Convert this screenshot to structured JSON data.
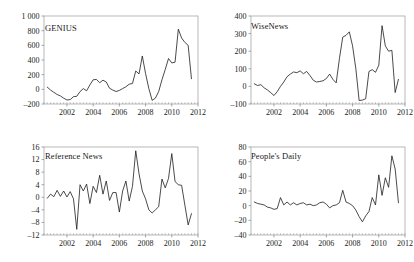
{
  "figure": {
    "type": "multi-panel-line-chart",
    "panel_count": 4,
    "layout": "2x2"
  },
  "chart_data": [
    {
      "type": "line",
      "title": "GENIUS",
      "panel": "top-left",
      "xlabel": "",
      "ylabel": "",
      "xlim": [
        2000.25,
        2012.0
      ],
      "ylim": [
        -200,
        1000
      ],
      "yticks": [
        -200,
        0,
        200,
        400,
        600,
        800,
        1000
      ],
      "ytick_labels": [
        "-200",
        "0",
        "200",
        "400",
        "600",
        "800",
        "1 000"
      ],
      "xticks": [
        2002,
        2004,
        2006,
        2008,
        2010,
        2012
      ],
      "xtick_labels": [
        "2002",
        "2004",
        "2006",
        "2008",
        "2010",
        "2012"
      ],
      "grid": false,
      "legend": "none",
      "x": [
        2000.5,
        2000.75,
        2001.0,
        2001.25,
        2001.5,
        2001.75,
        2002.0,
        2002.25,
        2002.5,
        2002.75,
        2003.0,
        2003.25,
        2003.5,
        2003.75,
        2004.0,
        2004.25,
        2004.5,
        2004.75,
        2005.0,
        2005.25,
        2005.5,
        2005.75,
        2006.0,
        2006.25,
        2006.5,
        2006.75,
        2007.0,
        2007.25,
        2007.5,
        2007.75,
        2008.0,
        2008.25,
        2008.5,
        2008.75,
        2009.0,
        2009.25,
        2009.5,
        2009.75,
        2010.0,
        2010.25,
        2010.5,
        2010.75,
        2011.0,
        2011.25,
        2011.5
      ],
      "values": [
        30,
        -10,
        -40,
        -70,
        -90,
        -120,
        -145,
        -140,
        -100,
        -95,
        -30,
        10,
        -20,
        60,
        130,
        135,
        90,
        125,
        100,
        15,
        -10,
        -30,
        -15,
        10,
        35,
        70,
        80,
        250,
        210,
        455,
        215,
        10,
        -150,
        -120,
        -30,
        130,
        270,
        420,
        360,
        370,
        820,
        700,
        640,
        600,
        145
      ]
    },
    {
      "type": "line",
      "title": "WiseNews",
      "panel": "top-right",
      "xlabel": "",
      "ylabel": "",
      "xlim": [
        2000.25,
        2012.0
      ],
      "ylim": [
        -100,
        400
      ],
      "yticks": [
        -100,
        0,
        100,
        200,
        300,
        400
      ],
      "ytick_labels": [
        "-100",
        "0",
        "100",
        "200",
        "300",
        "400"
      ],
      "xticks": [
        2002,
        2004,
        2006,
        2008,
        2010,
        2012
      ],
      "xtick_labels": [
        "2002",
        "2004",
        "2006",
        "2008",
        "2010",
        "2012"
      ],
      "grid": false,
      "legend": "none",
      "x": [
        2000.5,
        2000.75,
        2001.0,
        2001.25,
        2001.5,
        2001.75,
        2002.0,
        2002.25,
        2002.5,
        2002.75,
        2003.0,
        2003.25,
        2003.5,
        2003.75,
        2004.0,
        2004.25,
        2004.5,
        2004.75,
        2005.0,
        2005.25,
        2005.5,
        2005.75,
        2006.0,
        2006.25,
        2006.5,
        2006.75,
        2007.0,
        2007.25,
        2007.5,
        2007.75,
        2008.0,
        2008.25,
        2008.5,
        2008.75,
        2009.0,
        2009.25,
        2009.5,
        2009.75,
        2010.0,
        2010.25,
        2010.5,
        2010.75,
        2011.0,
        2011.25,
        2011.5
      ],
      "values": [
        15,
        5,
        10,
        -8,
        -20,
        -35,
        -52,
        -30,
        0,
        25,
        55,
        70,
        82,
        78,
        88,
        72,
        85,
        62,
        35,
        25,
        28,
        32,
        45,
        70,
        40,
        20,
        160,
        280,
        290,
        310,
        230,
        100,
        -80,
        -78,
        -70,
        85,
        95,
        80,
        120,
        345,
        230,
        200,
        205,
        -35,
        40
      ]
    },
    {
      "type": "line",
      "title": "Reference News",
      "panel": "bottom-left",
      "xlabel": "",
      "ylabel": "",
      "xlim": [
        2000.25,
        2012.0
      ],
      "ylim": [
        -12,
        16
      ],
      "yticks": [
        -12,
        -8,
        -4,
        0,
        4,
        8,
        12,
        16
      ],
      "ytick_labels": [
        "-12",
        "-8",
        "-4",
        "0",
        "4",
        "8",
        "12",
        "16"
      ],
      "xticks": [
        2002,
        2004,
        2006,
        2008,
        2010,
        2012
      ],
      "xtick_labels": [
        "2002",
        "2004",
        "2006",
        "2008",
        "2010",
        "2012"
      ],
      "grid": false,
      "legend": "none",
      "x": [
        2000.5,
        2000.75,
        2001.0,
        2001.25,
        2001.5,
        2001.75,
        2002.0,
        2002.25,
        2002.5,
        2002.75,
        2003.0,
        2003.25,
        2003.5,
        2003.75,
        2004.0,
        2004.25,
        2004.5,
        2004.75,
        2005.0,
        2005.25,
        2005.5,
        2005.75,
        2006.0,
        2006.25,
        2006.5,
        2006.75,
        2007.0,
        2007.25,
        2007.5,
        2007.75,
        2008.0,
        2008.25,
        2008.5,
        2008.75,
        2009.0,
        2009.25,
        2009.5,
        2009.75,
        2010.0,
        2010.25,
        2010.5,
        2010.75,
        2011.0,
        2011.25,
        2011.5
      ],
      "values": [
        -0.3,
        1.0,
        0.2,
        2.2,
        0.3,
        2.0,
        0.1,
        1.8,
        -0.5,
        -10.2,
        4.0,
        2.0,
        4.2,
        -2.0,
        3.5,
        1.5,
        7.0,
        1.0,
        5.2,
        -1.0,
        1.5,
        1.5,
        -4.7,
        2.0,
        5.2,
        -1.2,
        3.5,
        14.8,
        7.5,
        2.0,
        -0.5,
        -4.0,
        -5.0,
        -4.0,
        -3.0,
        5.8,
        3.0,
        6.0,
        13.9,
        5.0,
        4.0,
        3.8,
        -2.5,
        -8.8,
        -5.2
      ]
    },
    {
      "type": "line",
      "title": "People's Daily",
      "panel": "bottom-right",
      "xlabel": "",
      "ylabel": "",
      "xlim": [
        2000.25,
        2012.0
      ],
      "ylim": [
        -40,
        80
      ],
      "yticks": [
        -40,
        -20,
        0,
        20,
        40,
        60,
        80
      ],
      "ytick_labels": [
        "-40",
        "-20",
        "0",
        "20",
        "40",
        "60",
        "80"
      ],
      "xticks": [
        2002,
        2004,
        2006,
        2008,
        2010,
        2012
      ],
      "xtick_labels": [
        "2002",
        "2004",
        "2006",
        "2008",
        "2010",
        "2012"
      ],
      "grid": false,
      "legend": "none",
      "x": [
        2000.5,
        2000.75,
        2001.0,
        2001.25,
        2001.5,
        2001.75,
        2002.0,
        2002.25,
        2002.5,
        2002.75,
        2003.0,
        2003.25,
        2003.5,
        2003.75,
        2004.0,
        2004.25,
        2004.5,
        2004.75,
        2005.0,
        2005.25,
        2005.5,
        2005.75,
        2006.0,
        2006.25,
        2006.5,
        2006.75,
        2007.0,
        2007.25,
        2007.5,
        2007.75,
        2008.0,
        2008.25,
        2008.5,
        2008.75,
        2009.0,
        2009.25,
        2009.5,
        2009.75,
        2010.0,
        2010.25,
        2010.5,
        2010.75,
        2011.0,
        2011.25,
        2011.5
      ],
      "values": [
        5,
        3,
        2,
        1,
        -2,
        -3,
        -5,
        -4,
        11,
        1,
        5,
        1,
        4,
        1,
        3,
        4,
        1,
        2,
        0,
        1,
        4,
        5,
        2,
        -3,
        0,
        1,
        4,
        21,
        5,
        3,
        0,
        -6,
        -15,
        -22,
        -14,
        -8,
        11,
        1,
        42,
        14,
        38,
        25,
        68,
        50,
        4
      ]
    }
  ]
}
